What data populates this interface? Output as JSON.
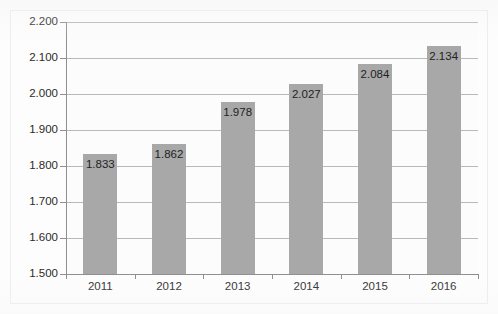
{
  "chart_data": {
    "type": "bar",
    "title": "",
    "xlabel": "",
    "ylabel": "",
    "categories": [
      "2011",
      "2012",
      "2013",
      "2014",
      "2015",
      "2016"
    ],
    "values": [
      1833,
      1862,
      1978,
      2027,
      2084,
      2134
    ],
    "value_labels": [
      "1.833",
      "1.862",
      "1.978",
      "2.027",
      "2.084",
      "2.134"
    ],
    "ylim": [
      1500,
      2200
    ],
    "y_ticks": [
      1500,
      1600,
      1700,
      1800,
      1900,
      2000,
      2100,
      2200
    ],
    "y_tick_labels": [
      "1.500",
      "1.600",
      "1.700",
      "1.800",
      "1.900",
      "2.000",
      "2.100",
      "2.200"
    ],
    "grid": true,
    "legend": false,
    "legend_position": "none",
    "series": [
      {
        "name": "",
        "values": [
          1833,
          1862,
          1978,
          2027,
          2084,
          2134
        ]
      }
    ],
    "colors": {
      "bar_fill": "#a8a8a8",
      "gridline": "#b9b9b9",
      "axis_line": "#8f8f8f",
      "text": "#2b2b2b",
      "plot_background": "#fcfcfc",
      "frame_border": "#ededed"
    }
  }
}
